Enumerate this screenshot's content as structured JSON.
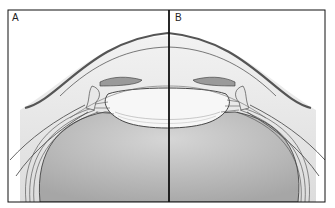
{
  "figure": {
    "type": "anatomical cross-section diagram (eye anterior segment, accommodation comparison)",
    "panels": [
      {
        "label": "A"
      },
      {
        "label": "B"
      }
    ],
    "colors": {
      "frame": "#111111",
      "sclera_band": "#6a6a6a",
      "vitreous_fill": "#bdbdbd",
      "lens_fill": "#f4f4f4",
      "background": "#ffffff"
    }
  }
}
